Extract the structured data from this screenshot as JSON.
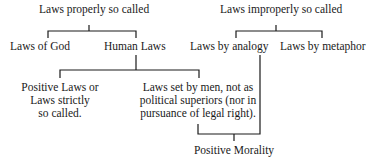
{
  "diagram": {
    "left_root": {
      "label": "Laws properly so called",
      "children": [
        {
          "label": "Laws of God"
        },
        {
          "label": "Human Laws",
          "children": [
            {
              "lines": [
                "Positive Laws or",
                "Laws strictly",
                "so called."
              ]
            },
            {
              "lines": [
                "Laws set by men, not as",
                "political superiors (nor in",
                "pursuance of legal right)."
              ]
            }
          ]
        }
      ]
    },
    "right_root": {
      "label": "Laws improperly so called",
      "children": [
        {
          "label": "Laws by analogy"
        },
        {
          "label": "Laws by metaphor"
        }
      ]
    },
    "merge_node": {
      "label": "Positive Morality",
      "from": [
        "Laws set by men, not as political superiors (nor in pursuance of legal right).",
        "Laws by analogy"
      ]
    },
    "line_color": "#1a1a1a",
    "background": "#ffffff"
  }
}
